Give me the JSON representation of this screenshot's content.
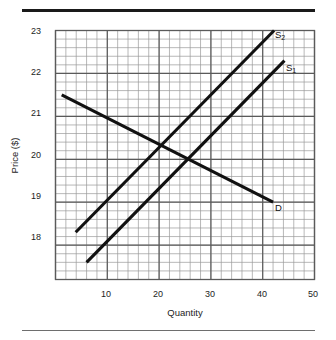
{
  "figure": {
    "has_top_rule": true,
    "has_bottom_rule": true,
    "background": "#ffffff",
    "line_color": "#111111",
    "grid_major_color": "#5a5a5a",
    "grid_minor_color": "#9a9a9a"
  },
  "chart_data": {
    "type": "line",
    "title": "",
    "xlabel": "Quantity",
    "ylabel": "Price ($)",
    "xlim": [
      0,
      50
    ],
    "ylim": [
      17.2,
      23
    ],
    "xticks": [
      10,
      20,
      30,
      40,
      50
    ],
    "yticks": [
      18,
      19,
      20,
      21,
      22,
      23
    ],
    "xtick_labels": [
      "10",
      "20",
      "30",
      "40",
      "50"
    ],
    "ytick_labels": [
      "18",
      "19",
      "20",
      "21",
      "22",
      "23"
    ],
    "grid": true,
    "grid_major_step_x": 10,
    "grid_major_step_y": 1,
    "grid_minor_step_x": 2,
    "grid_minor_step_y": 0.2,
    "legend": "inline-labels",
    "legend_position": "right-of-curve-end",
    "series": [
      {
        "name": "D",
        "label": "D",
        "label_sub": "",
        "kind": "demand",
        "points": [
          [
            1.2,
            21.5
          ],
          [
            42.0,
            19.0
          ]
        ],
        "label_xy": [
          43.2,
          18.85
        ]
      },
      {
        "name": "S1",
        "label": "S",
        "label_sub": "1",
        "kind": "supply",
        "points": [
          [
            6.0,
            17.6
          ],
          [
            44.2,
            22.3
          ]
        ],
        "label_xy": [
          45.4,
          22.18
        ]
      },
      {
        "name": "S2",
        "label": "S",
        "label_sub": "2",
        "kind": "supply",
        "points": [
          [
            3.9,
            18.3
          ],
          [
            42.2,
            23.0
          ]
        ],
        "label_xy": [
          43.4,
          22.85
        ]
      }
    ],
    "equilibria": [
      {
        "label": "S1 x D",
        "x": 25.8,
        "y": 20.0
      },
      {
        "label": "S2 x D",
        "x": 20.8,
        "y": 20.3
      }
    ],
    "annotations": []
  }
}
